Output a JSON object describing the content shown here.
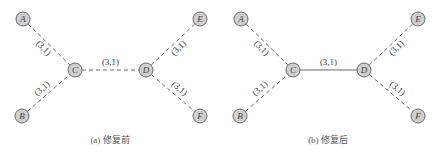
{
  "figure": {
    "panels": [
      {
        "id": "a",
        "caption": "(a) 修复前",
        "offset_x": 0,
        "nodes": [
          {
            "id": "A",
            "label": "A",
            "x": 23,
            "y": 19
          },
          {
            "id": "B",
            "label": "B",
            "x": 22,
            "y": 116
          },
          {
            "id": "C",
            "label": "C",
            "x": 75,
            "y": 70
          },
          {
            "id": "D",
            "label": "D",
            "x": 146,
            "y": 70
          },
          {
            "id": "E",
            "label": "E",
            "x": 200,
            "y": 19
          },
          {
            "id": "F",
            "label": "F",
            "x": 200,
            "y": 116
          }
        ],
        "edges": [
          {
            "from": "A",
            "to": "C",
            "label": "(3,1)",
            "style": "dashed"
          },
          {
            "from": "B",
            "to": "C",
            "label": "(3,1)",
            "style": "dashed"
          },
          {
            "from": "C",
            "to": "D",
            "label": "(3,1)",
            "style": "dashed"
          },
          {
            "from": "D",
            "to": "E",
            "label": "(3,1)",
            "style": "dashed"
          },
          {
            "from": "D",
            "to": "F",
            "label": "(3,1)",
            "style": "dashed"
          }
        ]
      },
      {
        "id": "b",
        "caption": "(b) 修复后",
        "offset_x": 218,
        "nodes": [
          {
            "id": "A",
            "label": "A",
            "x": 23,
            "y": 19
          },
          {
            "id": "B",
            "label": "B",
            "x": 22,
            "y": 116
          },
          {
            "id": "C",
            "label": "C",
            "x": 75,
            "y": 70
          },
          {
            "id": "D",
            "label": "D",
            "x": 146,
            "y": 70
          },
          {
            "id": "E",
            "label": "E",
            "x": 200,
            "y": 19
          },
          {
            "id": "F",
            "label": "F",
            "x": 200,
            "y": 116
          }
        ],
        "edges": [
          {
            "from": "A",
            "to": "C",
            "label": "(3,1)",
            "style": "dashed"
          },
          {
            "from": "B",
            "to": "C",
            "label": "(3,1)",
            "style": "dashed"
          },
          {
            "from": "C",
            "to": "D",
            "label": "(3,1)",
            "style": "solid"
          },
          {
            "from": "D",
            "to": "E",
            "label": "(3,1)",
            "style": "dashed"
          },
          {
            "from": "D",
            "to": "F",
            "label": "(3,1)",
            "style": "dashed"
          }
        ]
      }
    ]
  },
  "colors": {
    "node_fill": "#cfcfcf",
    "stroke": "#6a6a6a",
    "text": "#444444"
  }
}
